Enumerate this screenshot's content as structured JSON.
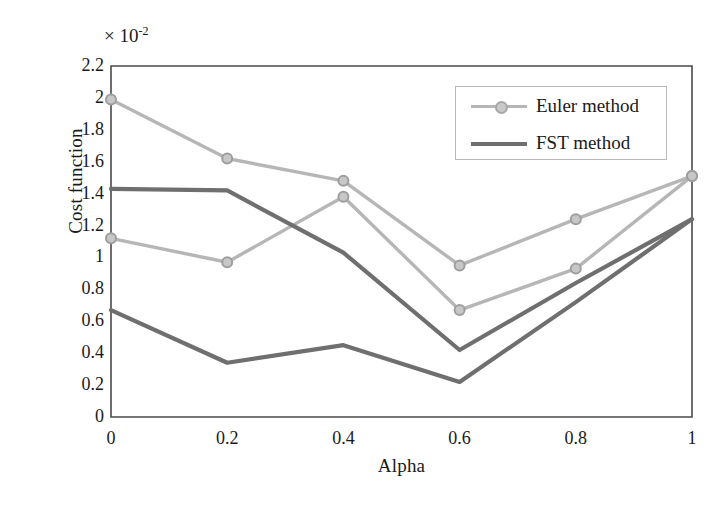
{
  "chart_data": {
    "type": "line",
    "title": "",
    "xlabel": "Alpha",
    "ylabel": "Cost function",
    "y_scale_annotation": "× 10",
    "y_scale_exponent": "-2",
    "xlim": [
      0,
      1
    ],
    "ylim": [
      0,
      2.2
    ],
    "x": [
      0,
      0.2,
      0.4,
      0.6,
      0.8,
      1
    ],
    "xticks": [
      "0",
      "0.2",
      "0.4",
      "0.6",
      "0.8",
      "1"
    ],
    "yticks": [
      "0",
      "0.2",
      "0.4",
      "0.6",
      "0.8",
      "1",
      "1.2",
      "1.4",
      "1.6",
      "1.8",
      "2",
      "2.2"
    ],
    "grid": false,
    "legend_position": "upper right",
    "series": [
      {
        "name": "Euler method",
        "label_key": "euler-upper",
        "legend_entry": "Euler method",
        "color": "#b6b6b6",
        "marker": "circle",
        "values": [
          1.99,
          1.62,
          1.48,
          0.95,
          1.24,
          1.51
        ]
      },
      {
        "name": "Euler method",
        "label_key": "euler-lower",
        "legend_entry": "Euler method",
        "color": "#b6b6b6",
        "marker": "circle",
        "values": [
          1.12,
          0.97,
          1.38,
          0.67,
          0.93,
          1.51
        ]
      },
      {
        "name": "FST method",
        "label_key": "fst-upper",
        "legend_entry": "FST method",
        "color": "#6f6f6f",
        "marker": "none",
        "values": [
          1.43,
          1.42,
          1.03,
          0.42,
          0.84,
          1.24
        ]
      },
      {
        "name": "FST method",
        "label_key": "fst-lower",
        "legend_entry": "FST method",
        "color": "#6f6f6f",
        "marker": "none",
        "values": [
          0.67,
          0.34,
          0.45,
          0.22,
          0.72,
          1.24
        ]
      }
    ],
    "legend": [
      {
        "label": "Euler method",
        "color": "#b6b6b6",
        "marker": "circle"
      },
      {
        "label": "FST method",
        "color": "#6f6f6f",
        "marker": "none"
      }
    ]
  },
  "colors": {
    "euler": "#b6b6b6",
    "fst": "#6f6f6f",
    "axis": "#4a4a4a",
    "text": "#1a1a1a",
    "legend_border": "#b9b9b9"
  }
}
